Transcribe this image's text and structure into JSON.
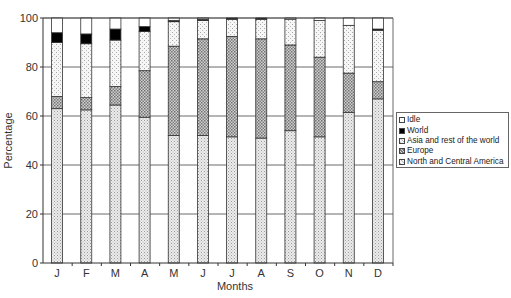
{
  "chart_data": {
    "type": "bar",
    "stacked": true,
    "title": "",
    "xlabel": "Months",
    "ylabel": "Percentage",
    "ylim": [
      0,
      100
    ],
    "yticks": [
      0,
      20,
      40,
      60,
      80,
      100
    ],
    "grid": true,
    "legend_position": "right",
    "categories": [
      "J",
      "F",
      "M",
      "A",
      "M",
      "J",
      "J",
      "A",
      "S",
      "O",
      "N",
      "D"
    ],
    "series": [
      {
        "name": "North and Central America",
        "color": "#e2e2e2",
        "pattern": "fine-dots",
        "values": [
          63,
          62.5,
          64.5,
          59.5,
          52,
          52,
          51.5,
          51,
          54,
          51.5,
          61.5,
          67
        ]
      },
      {
        "name": "Europe",
        "color": "#b8b8b8",
        "pattern": "cross-hatch",
        "values": [
          5,
          5,
          7.5,
          19,
          36.5,
          39.5,
          41,
          40.5,
          35,
          32.5,
          16,
          7
        ]
      },
      {
        "name": "Asia and rest of the world",
        "color": "#efefef",
        "pattern": "light-dots",
        "values": [
          22,
          22,
          19,
          16,
          10,
          7.5,
          7,
          8,
          10.5,
          15,
          19.5,
          21
        ]
      },
      {
        "name": "World",
        "color": "#000000",
        "pattern": "solid",
        "values": [
          4,
          4,
          4.5,
          2,
          0.5,
          0.5,
          0.5,
          0.5,
          0,
          0,
          0,
          0.5
        ]
      },
      {
        "name": "Idle",
        "color": "#ffffff",
        "pattern": "none",
        "values": [
          6,
          6.5,
          4.5,
          3.5,
          1,
          0.5,
          0,
          0,
          0.5,
          1,
          3,
          4.5
        ]
      }
    ]
  },
  "legend": {
    "items": [
      {
        "label": "Idle",
        "key": "Idle"
      },
      {
        "label": "World",
        "key": "World"
      },
      {
        "label": "Asia and rest of the world",
        "key": "Asia and rest of the world"
      },
      {
        "label": "Europe",
        "key": "Europe"
      },
      {
        "label": "North and Central America",
        "key": "North and Central America"
      }
    ]
  }
}
